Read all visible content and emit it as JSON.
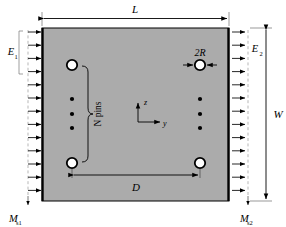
{
  "figure": {
    "type": "engineering-schematic",
    "plate": {
      "fill_color": "#ababab",
      "edge_color": "#000000",
      "x": 42,
      "y": 28,
      "width": 187,
      "height": 173
    },
    "dimensions": {
      "length": {
        "label": "L",
        "position": "top",
        "spans": "plate-width"
      },
      "width": {
        "label": "W",
        "position": "right-outer",
        "spans": "plate-height"
      },
      "pitch": {
        "label": "D",
        "position": "bottom-inner",
        "spans": "between-lower-holes"
      },
      "diameter": {
        "label": "2R",
        "position": "near-top-right-hole",
        "spans": "hole-diameter"
      }
    },
    "edge_labels": {
      "left_modulus": "E",
      "left_modulus_sub": "1",
      "right_modulus": "E",
      "right_modulus_sub": "2",
      "left_moment": "M",
      "left_moment_sub": "s1",
      "right_moment": "M",
      "right_moment_sub": "s2"
    },
    "annotations": {
      "pin_group": "N pins",
      "brace_side": "left-hole-column"
    },
    "axes": {
      "vertical_label": "z",
      "horizontal_label": "y",
      "origin_x": 148,
      "origin_y": 122
    },
    "holes": [
      {
        "name": "hole-top-left",
        "cx": 72,
        "cy": 65,
        "r": 5.2
      },
      {
        "name": "hole-top-right",
        "cx": 200,
        "cy": 65,
        "r": 5.2
      },
      {
        "name": "hole-bottom-left",
        "cx": 72,
        "cy": 163,
        "r": 5.2
      },
      {
        "name": "hole-bottom-right",
        "cx": 200,
        "cy": 163,
        "r": 5.2
      }
    ],
    "pin_dots": [
      {
        "cx": 72,
        "cy": 99
      },
      {
        "cx": 72,
        "cy": 114
      },
      {
        "cx": 72,
        "cy": 128
      },
      {
        "cx": 200,
        "cy": 99
      },
      {
        "cx": 200,
        "cy": 114
      },
      {
        "cx": 200,
        "cy": 128
      }
    ],
    "load_arrows": {
      "left_count": 13,
      "right_count": 13,
      "direction": "right",
      "left_x_start": 28,
      "right_x_start": 232
    }
  }
}
